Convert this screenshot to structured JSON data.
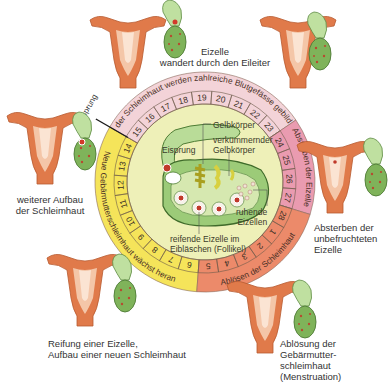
{
  "colors": {
    "yellow_phase": "#f5e45a",
    "lightpink_phase": "#f3d3d8",
    "pink_phase": "#ea9bb0",
    "salmon_phase": "#ec8a6a",
    "inner_disc": "#eef0b8",
    "ovary_green": "#a8cf86",
    "uterus_orange": "#e07a4a",
    "text": "#333333"
  },
  "ring": {
    "phases": [
      {
        "id": "growth",
        "label": "Neue Gebärmutterschleimhaut wächst heran",
        "days": [
          6,
          7,
          8,
          9,
          10,
          11,
          12,
          13,
          14
        ],
        "color": "#f5e45a"
      },
      {
        "id": "vessels",
        "label": "In der Schleimhaut werden zahlreiche Blutgefässe gebildet",
        "days": [
          15,
          16,
          17,
          18,
          19,
          20,
          21,
          22,
          23
        ],
        "color": "#f3d3d8"
      },
      {
        "id": "egg_death",
        "label": "Absterben der Eizelle",
        "days": [
          24,
          25,
          26,
          27
        ],
        "color": "#ea9bb0"
      },
      {
        "id": "shedding",
        "label": "Ablösen der Schleimhaut",
        "days": [
          28,
          1,
          2,
          3,
          4,
          5
        ],
        "color": "#ec8a6a"
      }
    ],
    "ovulation_marker": "Eisprung"
  },
  "center": {
    "labels": {
      "eisprung": "Eisprung",
      "gelbkoerper": "Gelbkörper",
      "verkuemmernder_line1": "verkümmernder",
      "verkuemmernder_line2": "Gelbkörper",
      "ruhende_line1": "ruhende",
      "ruhende_line2": "Eizellen",
      "reifende_line1": "reifende Eizelle im",
      "reifende_line2": "Eibläschen (Follikel)"
    }
  },
  "stages": [
    {
      "id": "top",
      "line1": "Eizelle",
      "line2": "wandert durch den Eileiter"
    },
    {
      "id": "left",
      "line1": "weiterer Aufbau",
      "line2": "der Schleimhaut"
    },
    {
      "id": "right",
      "line1": "Absterben der",
      "line2": "unbefruchteten",
      "line3": "Eizelle"
    },
    {
      "id": "bottom-left",
      "line1": "Reifung einer Eizelle,",
      "line2": "Aufbau einer neuen Schleimhaut"
    },
    {
      "id": "bottom-right",
      "line1": "Ablösung der Gebärmutter-",
      "line2": "schleimhaut (Menstruation)"
    }
  ]
}
